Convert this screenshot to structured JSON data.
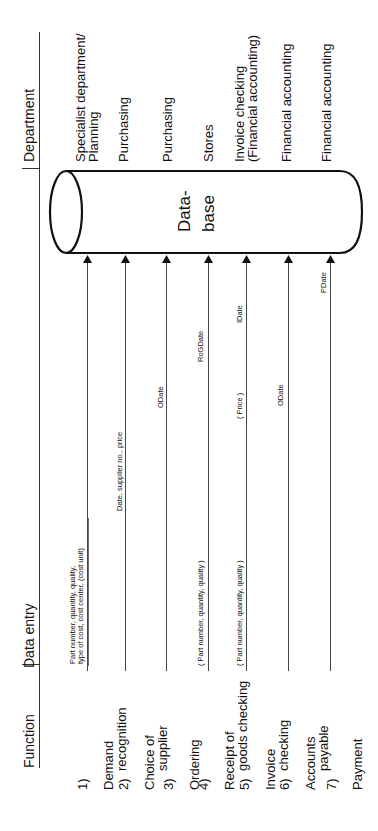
{
  "headers": {
    "function": "Function",
    "data_entry": "Data entry",
    "department": "Department"
  },
  "database": {
    "line1": "Data-",
    "line2": "base"
  },
  "rows": [
    {
      "num": "1)",
      "function_line1": "Demand",
      "function_line2": "recognition",
      "data_entry_line1": "Part number, quantity, quality,",
      "data_entry_line2": "type of cost, cost center, (cost unit)",
      "department_line1": "Specialist department/",
      "department_line2": "Planning"
    },
    {
      "num": "2)",
      "function_line1": "Choice of",
      "function_line2": "supplier",
      "data_entry": "Date, supplier no., price",
      "department": "Purchasing"
    },
    {
      "num": "3)",
      "function_line1": "Ordering",
      "data_entry": "ODate",
      "department": "Purchasing"
    },
    {
      "num": "4)",
      "function_line1": "Receipt of",
      "function_line2": "goods checking",
      "data_entry": "( Part number, quantity, quality )",
      "data_entry_date": "RoGDate",
      "department": "Stores"
    },
    {
      "num": "5)",
      "function_line1": "Invoice",
      "function_line2": "checking",
      "data_entry": "( Part number, quantity, quality )",
      "data_entry_price": "( Price )",
      "data_entry_date": "IDate",
      "department_line1": "Invoice checking",
      "department_line2": "(Financial accounting)"
    },
    {
      "num": "6)",
      "function_line1": "Accounts",
      "function_line2": "payable",
      "data_entry": "ODate",
      "department": "Financial accounting"
    },
    {
      "num": "7)",
      "function_line1": "Payment",
      "data_entry": "PDate",
      "department": "Financial accounting"
    }
  ],
  "colors": {
    "line": "#111111",
    "thin_line": "#444444",
    "background": "#ffffff"
  }
}
